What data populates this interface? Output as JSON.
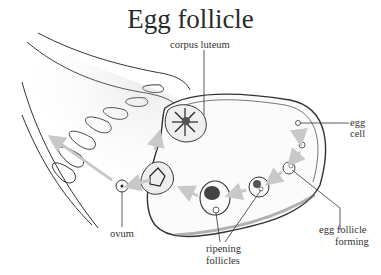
{
  "title": "Egg follicle",
  "labels": {
    "corpus_luteum": "corpus luteum",
    "egg_cell_line1": "egg",
    "egg_cell_line2": "cell",
    "egg_follicle_forming_line1": "egg follicle",
    "egg_follicle_forming_line2": "forming",
    "ripening_follicles_line1": "ripening",
    "ripening_follicles_line2": "follicles",
    "ovum": "ovum"
  },
  "colors": {
    "ink": "#222222",
    "arrow": "#c8c8c8",
    "stipple": "#d8d8d8"
  }
}
